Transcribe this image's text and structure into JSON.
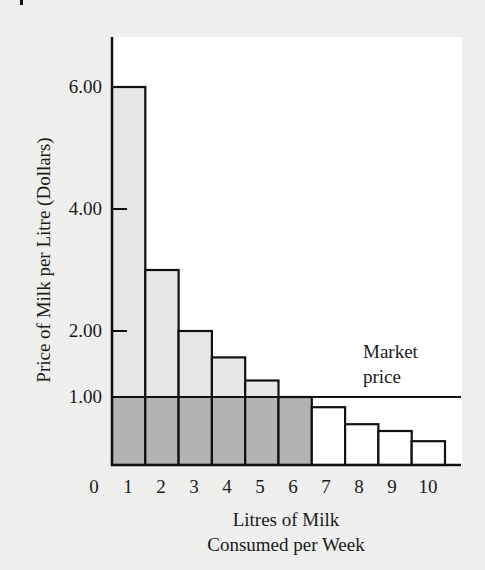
{
  "chart_data": {
    "type": "bar",
    "title": "",
    "xlabel": "Litres of Milk Consumed per Week",
    "xlabel_lines": [
      "Litres of Milk",
      "Consumed per Week"
    ],
    "ylabel": "Price of  Milk per Litre (Dollars)",
    "x_tick_labels": [
      "0",
      "1",
      "2",
      "3",
      "4",
      "5",
      "6",
      "7",
      "8",
      "9",
      "10"
    ],
    "y_tick_labels": [
      "6.00",
      "4.00",
      "2.00",
      "1.00"
    ],
    "y_ticks": [
      6.0,
      4.0,
      2.0,
      1.0
    ],
    "categories": [
      "1",
      "2",
      "3",
      "4",
      "5",
      "6",
      "7",
      "8",
      "9",
      "10"
    ],
    "values": [
      6.0,
      3.0,
      2.0,
      1.6,
      1.25,
      1.0,
      0.85,
      0.6,
      0.5,
      0.35
    ],
    "market_price": 1.0,
    "annotation": {
      "text_lines": [
        "Market",
        "price"
      ],
      "refers_to": "horizontal line at 1.00"
    },
    "shading": {
      "below_market_price_litres_1_to_6": "#b3b3b3",
      "above_market_price": "#e6e6e6",
      "litres_7_to_10": "#ffffff"
    },
    "ylim": [
      0,
      6.5
    ],
    "grid": false,
    "legend": "none"
  },
  "labels": {
    "ylabel": "Price of  Milk per Litre (Dollars)",
    "xlabel_line1": "Litres of Milk",
    "xlabel_line2": "Consumed per Week",
    "annot_line1": "Market",
    "annot_line2": "price",
    "yticks": [
      "6.00",
      "4.00",
      "2.00",
      "1.00"
    ],
    "xticks": [
      "0",
      "1",
      "2",
      "3",
      "4",
      "5",
      "6",
      "7",
      "8",
      "9",
      "10"
    ]
  }
}
